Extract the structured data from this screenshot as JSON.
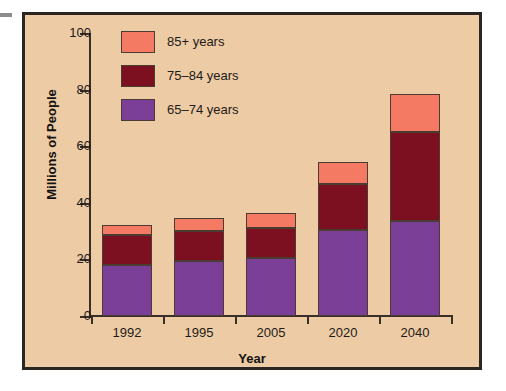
{
  "chart_data": {
    "type": "bar",
    "stacked": true,
    "title": "",
    "xlabel": "Year",
    "ylabel": "Millions of People",
    "categories": [
      "1992",
      "1995",
      "2005",
      "2020",
      "2040"
    ],
    "ylim": [
      0,
      100
    ],
    "yticks": [
      0,
      20,
      40,
      60,
      80,
      100
    ],
    "ytick_labels": [
      "0",
      "20",
      "40",
      "60",
      "80",
      "100"
    ],
    "grid": false,
    "legend_position": "top-left",
    "series": [
      {
        "name": "65–74 years",
        "color": "#7B3F98",
        "values": [
          18,
          19.5,
          20.5,
          30.5,
          33.5
        ]
      },
      {
        "name": "75–84 years",
        "color": "#7D1020",
        "values": [
          10.5,
          10.5,
          10.5,
          16,
          31.5
        ]
      },
      {
        "name": "85+ years",
        "color": "#F47A63",
        "values": [
          3.5,
          4.5,
          5.5,
          8,
          13.5
        ]
      }
    ],
    "totals": [
      32,
      34.5,
      36.5,
      54.5,
      78.5
    ]
  },
  "legend": {
    "items": [
      {
        "label": "85+ years",
        "color": "#F47A63"
      },
      {
        "label": "75–84 years",
        "color": "#7D1020"
      },
      {
        "label": "65–74 years",
        "color": "#7B3F98"
      }
    ]
  },
  "colors": {
    "background": "#edcba4",
    "frame_border": "#2b2622",
    "axis": "#3a2f28",
    "text": "#1d1a18",
    "series_85_plus": "#F47A63",
    "series_75_84": "#7D1020",
    "series_65_74": "#7B3F98"
  }
}
